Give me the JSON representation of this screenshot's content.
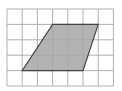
{
  "diagram": {
    "type": "grid-with-parallelogram",
    "grid": {
      "columns": 7,
      "rows": 5,
      "line_color": "#b0b0b0"
    },
    "shape": {
      "name": "parallelogram",
      "fill": "#a6a6a6",
      "stroke": "#444444",
      "vertices_grid": [
        [
          3,
          1
        ],
        [
          6,
          1
        ],
        [
          5,
          4
        ],
        [
          1,
          4
        ]
      ]
    }
  }
}
